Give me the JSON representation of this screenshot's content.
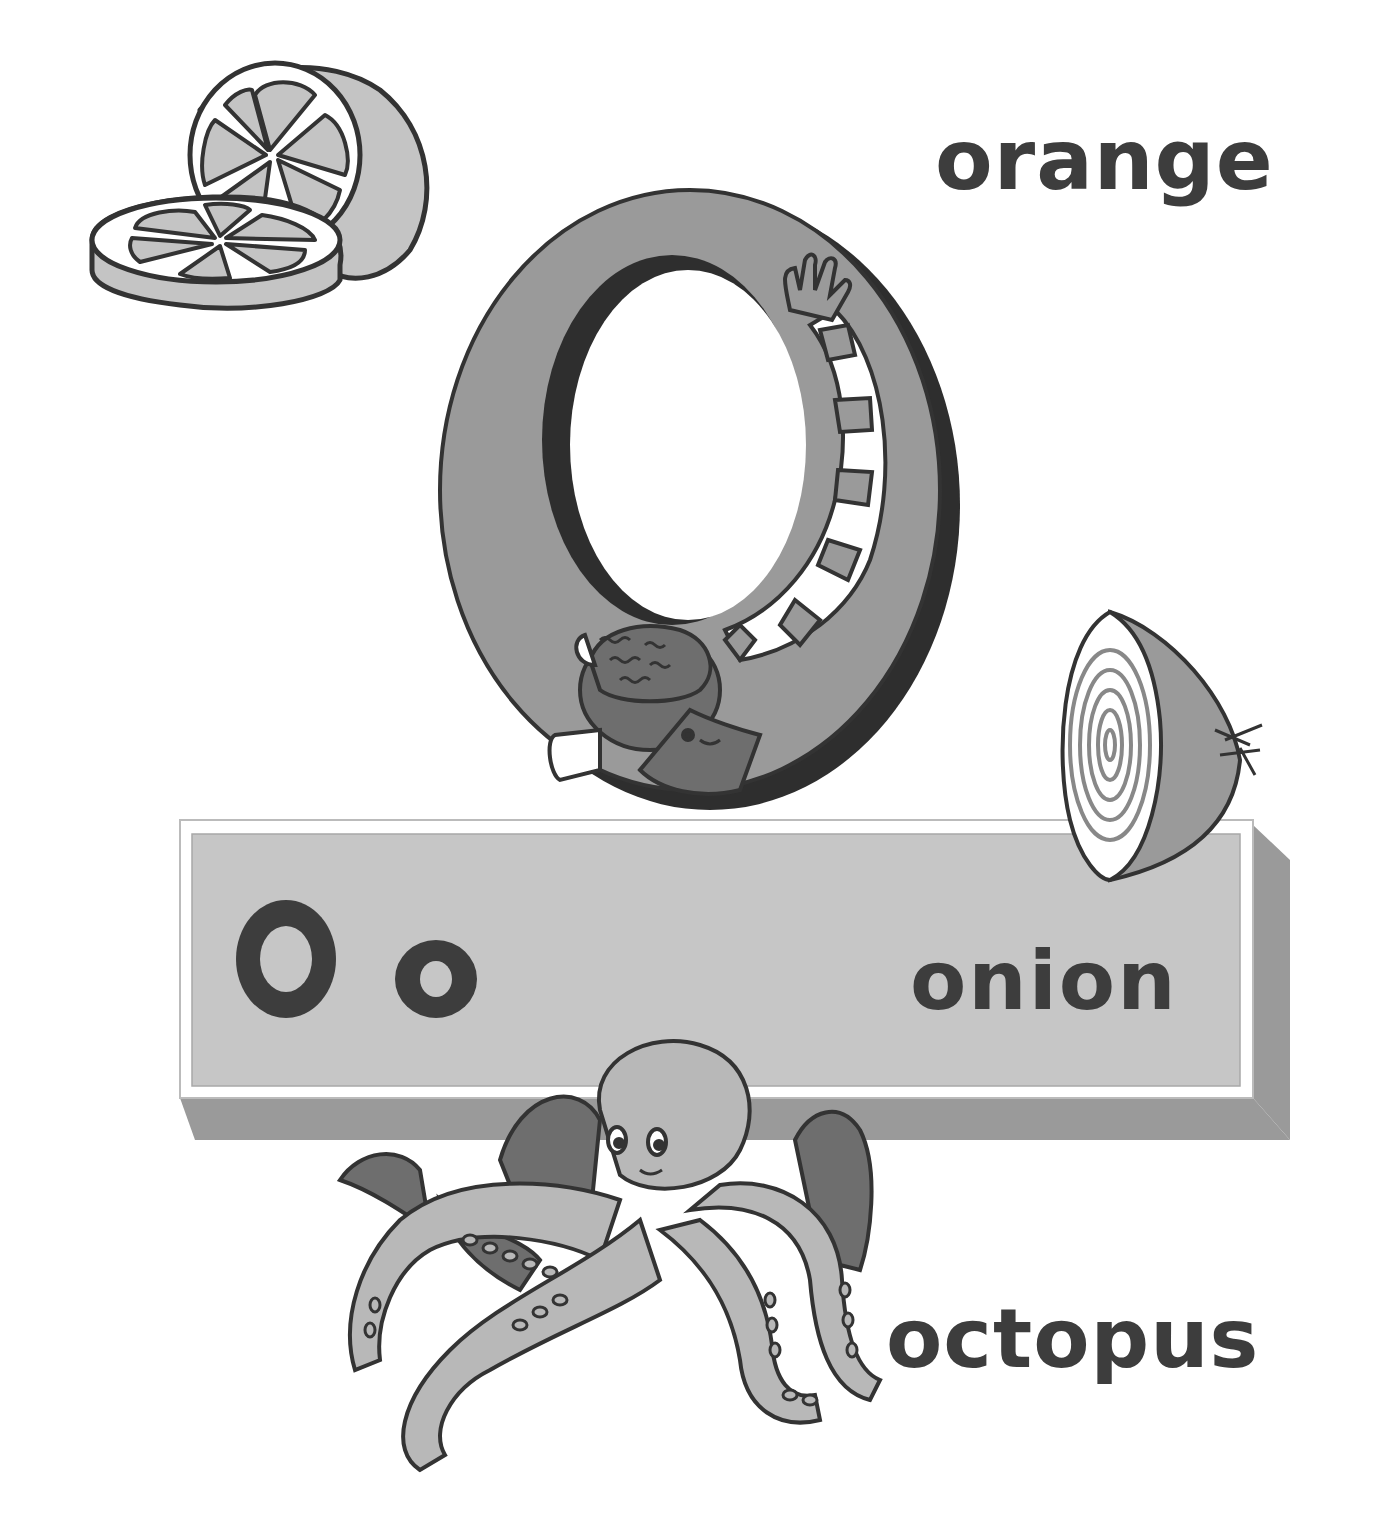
{
  "page": {
    "letter_upper": "O",
    "letter_lower": "o",
    "words": {
      "orange": "orange",
      "onion": "onion",
      "octopus": "octopus"
    }
  },
  "illustrations": [
    {
      "name": "orange-slices",
      "label": "orange"
    },
    {
      "name": "big-letter-o-child",
      "label": "letter O formed by a child"
    },
    {
      "name": "onion-half",
      "label": "onion"
    },
    {
      "name": "octopus",
      "label": "octopus"
    }
  ],
  "colors": {
    "text": "#3d3d3d",
    "outline": "#333333",
    "light_gray": "#c4c4c4",
    "mid_gray": "#9a9a9a",
    "dark_gray": "#6e6e6e",
    "shadow": "#2e2e2e",
    "white": "#ffffff"
  }
}
